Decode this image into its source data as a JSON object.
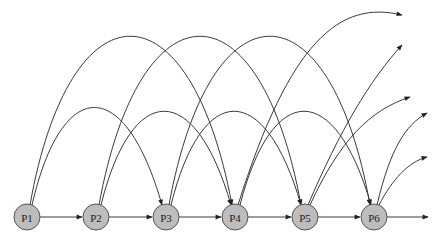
{
  "diagram": {
    "title": "",
    "colors": {
      "node_fill": "#bdbdbd",
      "node_stroke": "#555555",
      "edge": "#3a3a3a",
      "background": "#ffffff"
    },
    "nodes": [
      {
        "id": "P1",
        "label": "P1",
        "x": 27,
        "y": 217
      },
      {
        "id": "P2",
        "label": "P2",
        "x": 96,
        "y": 217
      },
      {
        "id": "P3",
        "label": "P3",
        "x": 166,
        "y": 217
      },
      {
        "id": "P4",
        "label": "P4",
        "x": 235,
        "y": 217
      },
      {
        "id": "P5",
        "label": "P5",
        "x": 305,
        "y": 217
      },
      {
        "id": "P6",
        "label": "P6",
        "x": 374,
        "y": 217
      }
    ],
    "edges": [
      {
        "from": "P1",
        "to": "P2",
        "type": "sequential"
      },
      {
        "from": "P2",
        "to": "P3",
        "type": "sequential"
      },
      {
        "from": "P3",
        "to": "P4",
        "type": "sequential"
      },
      {
        "from": "P4",
        "to": "P5",
        "type": "sequential"
      },
      {
        "from": "P5",
        "to": "P6",
        "type": "sequential"
      },
      {
        "from": "P6",
        "to": "out",
        "type": "sequential"
      },
      {
        "from": "P1",
        "to": "P3",
        "type": "skip-2"
      },
      {
        "from": "P2",
        "to": "P4",
        "type": "skip-2"
      },
      {
        "from": "P3",
        "to": "P5",
        "type": "skip-2"
      },
      {
        "from": "P4",
        "to": "P6",
        "type": "skip-2"
      },
      {
        "from": "P5",
        "to": "out",
        "type": "skip-2"
      },
      {
        "from": "P6",
        "to": "out",
        "type": "skip-2"
      },
      {
        "from": "P1",
        "to": "P4",
        "type": "skip-3"
      },
      {
        "from": "P2",
        "to": "P5",
        "type": "skip-3"
      },
      {
        "from": "P3",
        "to": "P6",
        "type": "skip-3"
      },
      {
        "from": "P4",
        "to": "out",
        "type": "skip-3"
      },
      {
        "from": "P5",
        "to": "out",
        "type": "skip-3"
      },
      {
        "from": "P6",
        "to": "out",
        "type": "skip-3"
      }
    ]
  }
}
